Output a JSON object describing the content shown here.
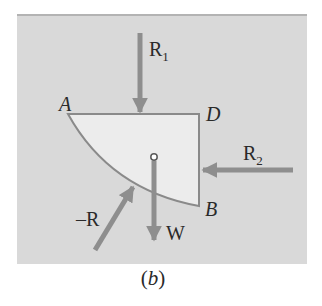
{
  "figure": {
    "caption": {
      "open": "(",
      "letter": "b",
      "close": ")"
    },
    "colors": {
      "panel_background": "#d9d9d9",
      "panel_top_border": "#b3b3b3",
      "body_fill": "#ececec",
      "body_outline": "#8a8a8a",
      "arrow": "#8e8e8e",
      "label_text": "#2a2a2a"
    },
    "body": {
      "shape": "quarter-circle segment bounded by straight edges AD and DB and curved edge AB",
      "vertices": [
        {
          "name": "A",
          "label": "A"
        },
        {
          "name": "D",
          "label": "D"
        },
        {
          "name": "B",
          "label": "B"
        }
      ],
      "centroid_marker": "small hollow circle"
    },
    "forces": [
      {
        "name": "R1",
        "label_main": "R",
        "label_sub": "1",
        "direction": "downward onto edge AD"
      },
      {
        "name": "R2",
        "label_main": "R",
        "label_sub": "2",
        "direction": "leftward onto edge DB"
      },
      {
        "name": "W",
        "label_main": "W",
        "label_sub": "",
        "direction": "downward from centroid"
      },
      {
        "name": "-R",
        "label_main": "–R",
        "label_sub": "",
        "direction": "up-right onto curved edge AB"
      }
    ]
  }
}
